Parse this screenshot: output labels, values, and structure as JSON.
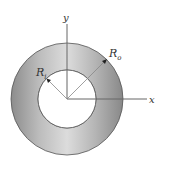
{
  "diagram": {
    "axes": {
      "x_label": "x",
      "y_label": "y"
    },
    "inner_radius": {
      "symbol": "R",
      "subscript": "i"
    },
    "outer_radius": {
      "symbol": "R",
      "subscript": "o"
    },
    "colors": {
      "ring_fill_light": "#d2d2d2",
      "ring_fill_dark": "#8f8f8f",
      "ring_edge": "#555555",
      "axis": "#666666",
      "hole_fill": "#ffffff"
    }
  }
}
